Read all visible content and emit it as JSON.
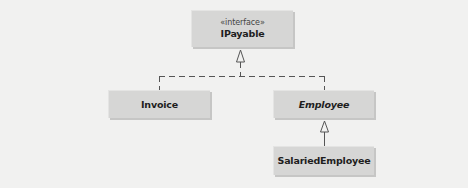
{
  "diagram": {
    "type": "uml-class-diagram",
    "nodes": [
      {
        "id": "ipayable",
        "stereotype": "«interface»",
        "name": "IPayable",
        "italic": false
      },
      {
        "id": "invoice",
        "name": "Invoice",
        "italic": false
      },
      {
        "id": "employee",
        "name": "Employee",
        "italic": true
      },
      {
        "id": "salaried",
        "name": "SalariedEmployee",
        "italic": false
      }
    ],
    "edges": [
      {
        "from": "invoice",
        "to": "ipayable",
        "kind": "realization",
        "style": "dashed"
      },
      {
        "from": "employee",
        "to": "ipayable",
        "kind": "realization",
        "style": "dashed"
      },
      {
        "from": "salaried",
        "to": "employee",
        "kind": "generalization",
        "style": "solid"
      }
    ],
    "colors": {
      "background": "#f1f1f0",
      "box_fill": "#d6d6d5",
      "line": "#555555"
    }
  }
}
